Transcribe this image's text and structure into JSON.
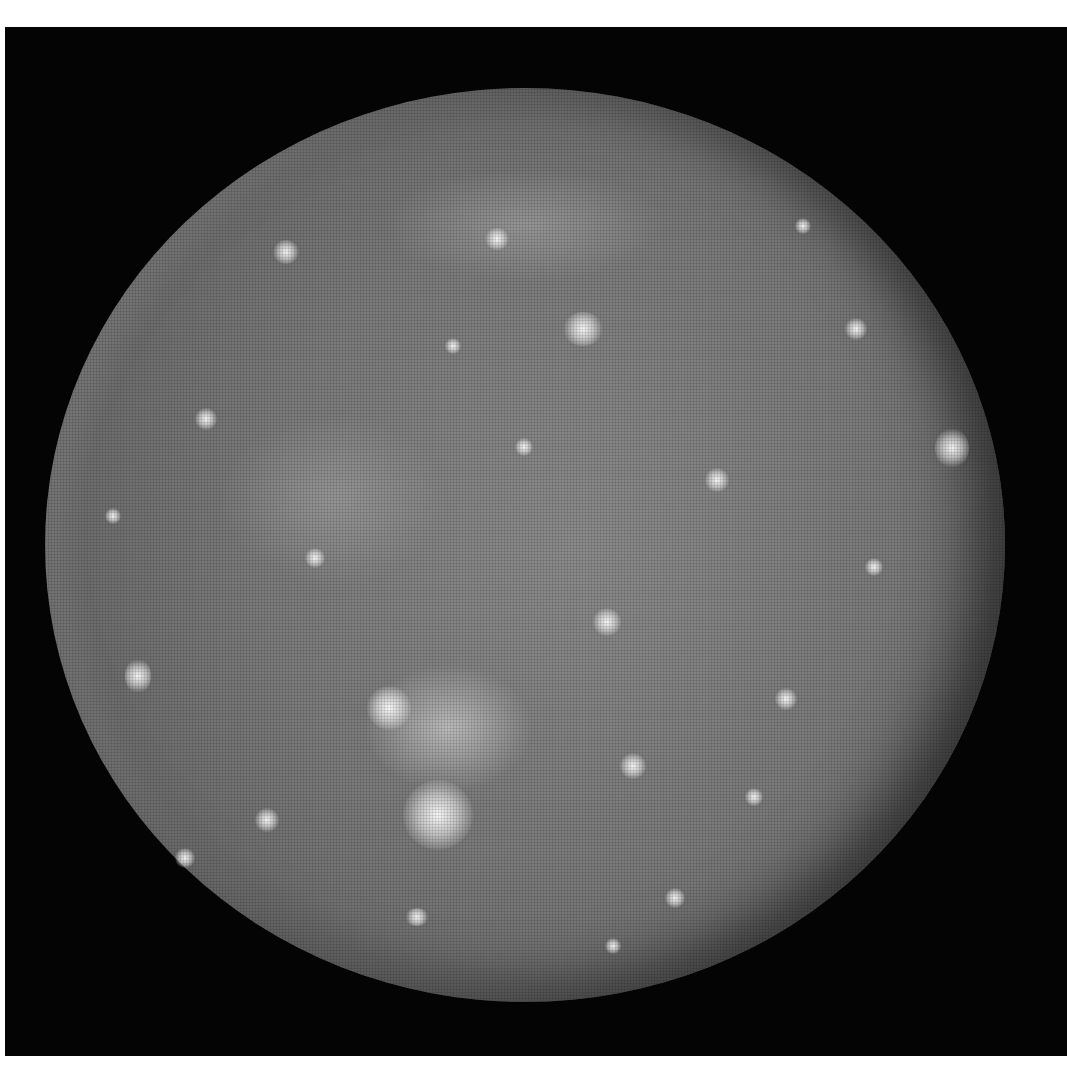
{
  "image": {
    "subject": "cratered moon",
    "description": "Grayscale photograph of a heavily cratered moon (resembling Callisto) on a black background, framed by a white border",
    "colors": {
      "page_background": "#ffffff",
      "frame_background": "#040404",
      "surface_mid": "#7a7a7a",
      "crater_highlight": "#f5f5f5"
    }
  }
}
